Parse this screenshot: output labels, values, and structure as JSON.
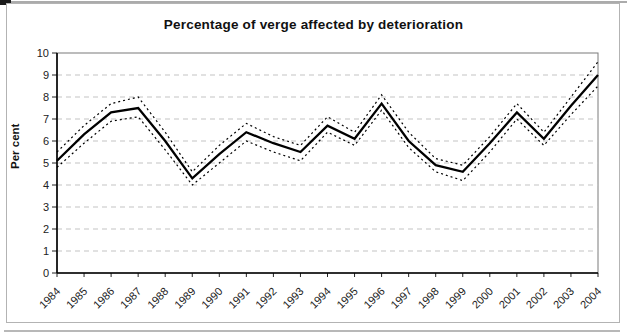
{
  "title": "Percentage of verge affected by deterioration",
  "chart_data": {
    "type": "line",
    "title": "Percentage of verge affected by deterioration",
    "xlabel": "",
    "ylabel": "Per cent",
    "ylim": [
      0,
      10
    ],
    "y_tick_step": 1,
    "grid": "horizontal-dashed",
    "legend": "none",
    "x": [
      1984,
      1985,
      1986,
      1987,
      1988,
      1989,
      1990,
      1991,
      1992,
      1993,
      1994,
      1995,
      1996,
      1997,
      1998,
      1999,
      2000,
      2001,
      2002,
      2003,
      2004
    ],
    "series": [
      {
        "name": "estimate",
        "style": "solid",
        "color": "#000000",
        "values": [
          5.1,
          6.3,
          7.3,
          7.5,
          6.0,
          4.3,
          5.4,
          6.4,
          5.9,
          5.5,
          6.7,
          6.1,
          7.7,
          6.0,
          4.9,
          4.6,
          5.9,
          7.3,
          6.1,
          7.6,
          9.0
        ]
      },
      {
        "name": "upper-band",
        "style": "dotted",
        "color": "#000000",
        "values": [
          5.5,
          6.7,
          7.7,
          8.0,
          6.4,
          4.6,
          5.8,
          6.8,
          6.2,
          5.8,
          7.1,
          6.4,
          8.1,
          6.4,
          5.2,
          4.9,
          6.2,
          7.7,
          6.4,
          8.0,
          9.6
        ]
      },
      {
        "name": "lower-band",
        "style": "dotted",
        "color": "#000000",
        "values": [
          4.8,
          5.9,
          6.9,
          7.1,
          5.6,
          4.0,
          5.0,
          6.0,
          5.5,
          5.1,
          6.4,
          5.8,
          7.4,
          5.7,
          4.6,
          4.2,
          5.5,
          7.0,
          5.8,
          7.2,
          8.5
        ]
      }
    ],
    "colors": {
      "line": "#000000",
      "grid": "#c3c3c3",
      "axis": "#000000",
      "plot_border": "#7a7a7a",
      "tick_label": "#222222"
    }
  }
}
